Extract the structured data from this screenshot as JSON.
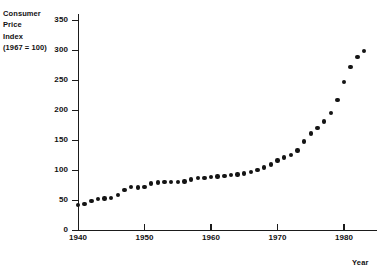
{
  "chart_data": {
    "type": "scatter",
    "title": "",
    "ylabel": "Consumer Price Index (1967 = 100)",
    "ylabel_lines": [
      "Consumer",
      "Price",
      "Index",
      "(1967 = 100)"
    ],
    "xlabel": "Year",
    "xlim": [
      1938.5,
      1984.5
    ],
    "ylim": [
      0,
      360
    ],
    "grid": false,
    "legend": null,
    "yticks": [
      0,
      50,
      100,
      150,
      200,
      250,
      300,
      350
    ],
    "ytick_labels": [
      "0",
      "50",
      "100",
      "150",
      "200",
      "250",
      "300",
      "350"
    ],
    "xticks": [
      1940,
      1950,
      1960,
      1970,
      1980
    ],
    "xtick_labels": [
      "1940",
      "1950",
      "1960",
      "1970",
      "1980"
    ],
    "marker_color": "#141414",
    "axis_color": "#1b1b1b",
    "x": [
      1940,
      1941,
      1942,
      1943,
      1944,
      1945,
      1946,
      1947,
      1948,
      1949,
      1950,
      1951,
      1952,
      1953,
      1954,
      1955,
      1956,
      1957,
      1958,
      1959,
      1960,
      1961,
      1962,
      1963,
      1964,
      1965,
      1966,
      1967,
      1968,
      1969,
      1970,
      1971,
      1972,
      1973,
      1974,
      1975,
      1976,
      1977,
      1978,
      1979,
      1980,
      1981,
      1982,
      1983
    ],
    "values": [
      42.0,
      44.1,
      48.8,
      51.8,
      52.7,
      53.9,
      58.5,
      66.9,
      72.1,
      71.4,
      72.1,
      77.8,
      79.5,
      80.1,
      80.5,
      80.2,
      81.4,
      84.3,
      86.6,
      87.3,
      88.7,
      89.6,
      90.6,
      91.7,
      92.9,
      94.5,
      97.2,
      100.0,
      104.2,
      109.8,
      116.3,
      121.3,
      125.3,
      133.1,
      147.7,
      161.2,
      170.5,
      181.5,
      195.4,
      217.4,
      246.8,
      272.4,
      289.1,
      298.4
    ],
    "point_count": 44
  },
  "figure": {
    "background": "#ffffff"
  }
}
